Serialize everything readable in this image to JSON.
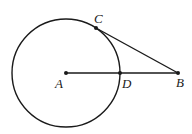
{
  "diagram": {
    "type": "geometry",
    "circle": {
      "center": "A",
      "cx": 66,
      "cy": 73,
      "r": 54
    },
    "points": {
      "A": {
        "label": "A",
        "x": 66,
        "y": 73
      },
      "B": {
        "label": "B",
        "x": 178,
        "y": 73
      },
      "C": {
        "label": "C",
        "x": 96,
        "y": 28
      },
      "D": {
        "label": "D",
        "x": 120,
        "y": 73
      }
    },
    "segments": [
      {
        "from": "A",
        "to": "B"
      },
      {
        "from": "C",
        "to": "B"
      }
    ],
    "stroke_color": "#1a1a1a"
  }
}
